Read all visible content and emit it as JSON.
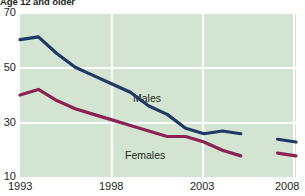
{
  "title": "Age 12 and older",
  "chart_data": {
    "type": "line",
    "title": "Age 12 and older",
    "xlabel": "",
    "ylabel": "",
    "xlim": [
      1993,
      2008
    ],
    "ylim": [
      10,
      70
    ],
    "grid": true,
    "legend_position": "inline-labels",
    "y_ticks": [
      70,
      50,
      30,
      10
    ],
    "x_ticks": [
      1993,
      1998,
      2003,
      2008
    ],
    "colors": {
      "males": "#1f3864",
      "females": "#8b2252",
      "plot_background": "#d3e5d2",
      "gridline": "#ffffff",
      "text": "#231f20"
    },
    "series": [
      {
        "name": "Males",
        "color": "#1f3864",
        "x": [
          1993,
          1994,
          1995,
          1996,
          1997,
          1998,
          1999,
          2000,
          2001,
          2002,
          2003,
          2004,
          2005
        ],
        "values": [
          60,
          61,
          55,
          50,
          47,
          44,
          41,
          36,
          33,
          28,
          26,
          27,
          26
        ],
        "break_after": 2005,
        "x2": [
          2007,
          2008
        ],
        "values2": [
          24,
          23
        ]
      },
      {
        "name": "Females",
        "color": "#8b2252",
        "x": [
          1993,
          1994,
          1995,
          1996,
          1997,
          1998,
          1999,
          2000,
          2001,
          2002,
          2003,
          2004,
          2005
        ],
        "values": [
          40,
          42,
          38,
          35,
          33,
          31,
          29,
          27,
          25,
          25,
          23,
          20,
          18
        ],
        "break_after": 2005,
        "x2": [
          2007,
          2008
        ],
        "values2": [
          19,
          18
        ]
      }
    ],
    "annotations": [
      {
        "text": "Males",
        "x": 1999.5,
        "y": 37
      },
      {
        "text": "Females",
        "x": 1998.8,
        "y": 20
      }
    ]
  },
  "axis": {
    "y_labels": [
      "70",
      "50",
      "30",
      "10"
    ],
    "x_labels": [
      "1993",
      "1998",
      "2003",
      "2008"
    ]
  }
}
